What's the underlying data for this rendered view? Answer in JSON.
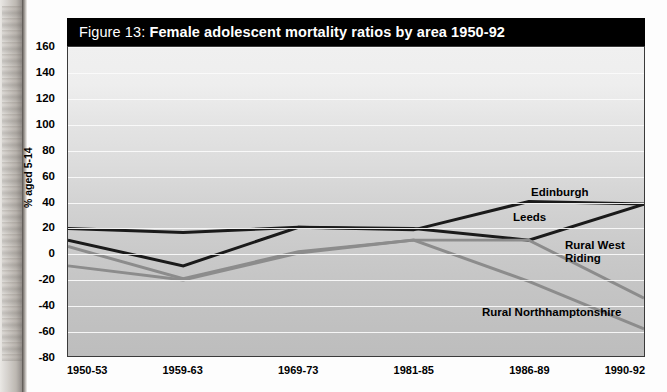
{
  "figure": {
    "number_label": "Figure 13: ",
    "title": "Female adolescent mortality ratios by area 1950-92"
  },
  "axis": {
    "ylabel": "% aged 5-14",
    "yticks": [
      "160",
      "140",
      "120",
      "100",
      "80",
      "60",
      "40",
      "20",
      "0",
      "-20",
      "-40",
      "-60",
      "-80"
    ],
    "xticks": [
      "1950-53",
      "1959-63",
      "1969-73",
      "1981-85",
      "1986-89",
      "1990-92"
    ]
  },
  "annotations": [
    {
      "name": "edinburgh",
      "text": "Edinburgh"
    },
    {
      "name": "leeds",
      "text": "Leeds"
    },
    {
      "name": "rural-west-riding",
      "text": "Rural West\nRiding"
    },
    {
      "name": "rural-northhamptonshire",
      "text": "Rural Northhamptonshire"
    }
  ],
  "colors": {
    "title_bar": "#000000",
    "title_text": "#ffffff",
    "plot_background": "#d8d8d8",
    "gridline": "#fbfbfb",
    "series_dark": "#1a1a1a",
    "series_grey": "#8c8c8c",
    "plot_border": "#3a3a3a"
  },
  "chart_data": {
    "type": "line",
    "title": "Figure 13: Female adolescent mortality ratios by area 1950-92",
    "xlabel": "",
    "ylabel": "% aged 5-14",
    "ylim": [
      -80,
      160
    ],
    "ytick_step": 20,
    "grid": true,
    "legend": "inline-labels",
    "categories": [
      "1950-53",
      "1959-63",
      "1969-73",
      "1981-85",
      "1986-89",
      "1990-92"
    ],
    "series": [
      {
        "name": "Edinburgh",
        "color": "#1a1a1a",
        "width": 3,
        "values": [
          19,
          16,
          20,
          18,
          40,
          38
        ]
      },
      {
        "name": "Leeds",
        "color": "#1a1a1a",
        "width": 3,
        "values": [
          10,
          -10,
          20,
          19,
          10,
          38
        ]
      },
      {
        "name": "Rural West Riding",
        "color": "#8c8c8c",
        "width": 3,
        "values": [
          5,
          -20,
          1,
          10,
          10,
          -35
        ]
      },
      {
        "name": "Rural Northhamptonshire",
        "color": "#8c8c8c",
        "width": 3,
        "values": [
          -10,
          -21,
          0,
          10,
          -22,
          -59
        ]
      }
    ]
  }
}
